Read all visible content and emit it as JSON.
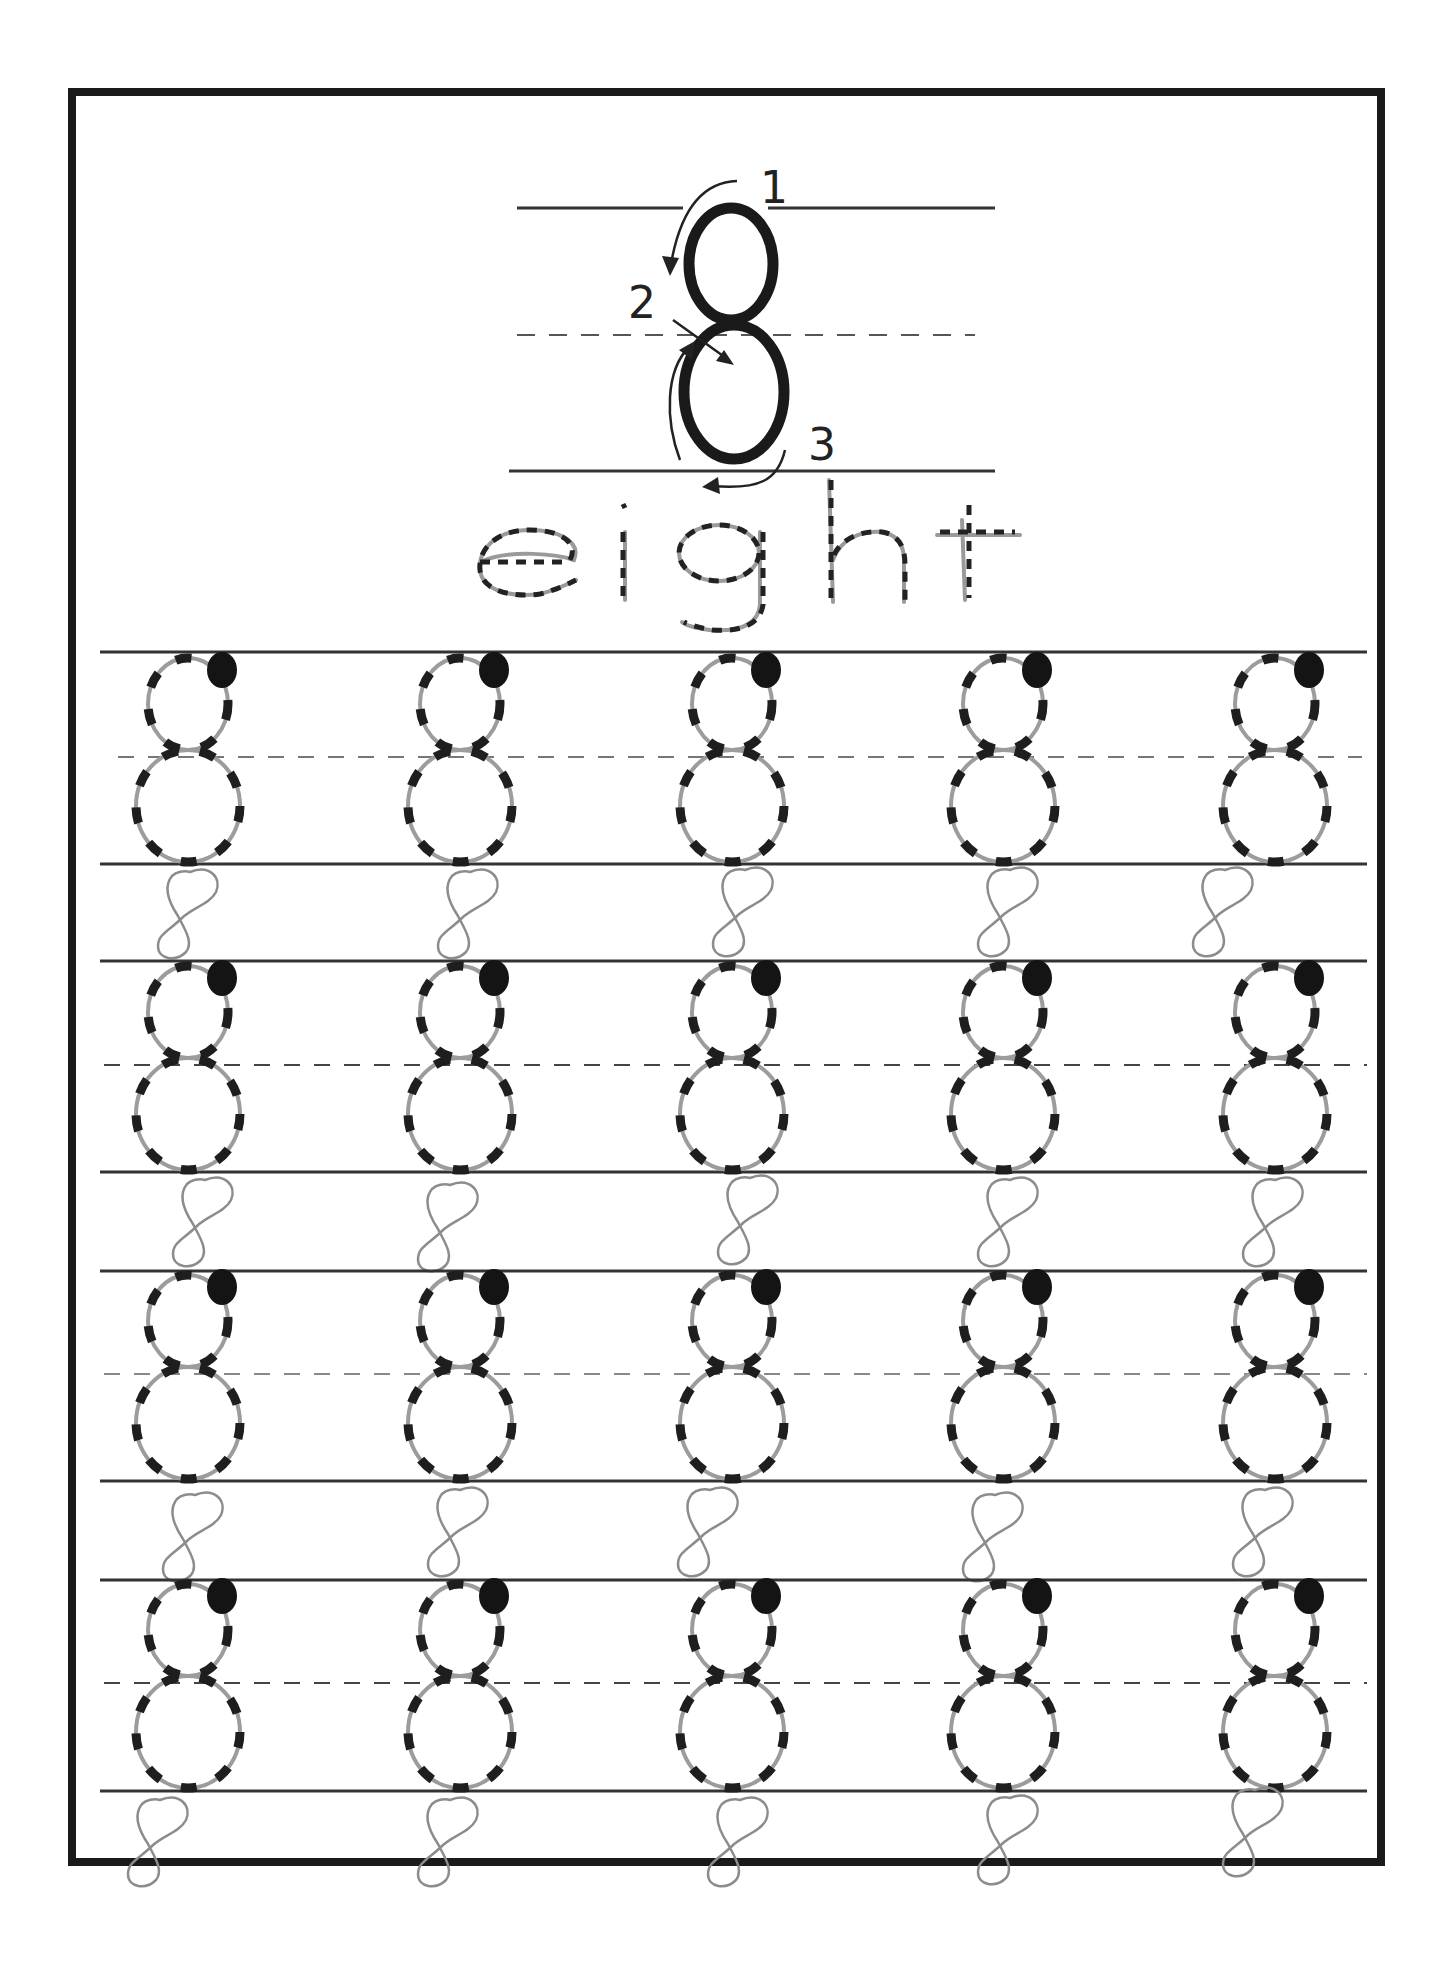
{
  "worksheet": {
    "title_numeral": "8",
    "word": "eight",
    "word_letters": [
      "e",
      "i",
      "g",
      "h",
      "t"
    ],
    "stroke_steps": [
      "1",
      "2",
      "3"
    ],
    "colors": {
      "ink": "#1a1a1a",
      "pencil": "#9a9a9a",
      "line": "#333333",
      "paper": "#ffffff"
    },
    "practice": {
      "rows": 4,
      "columns": 5,
      "traced_glyph": "8",
      "freehand_glyph": "8"
    }
  }
}
